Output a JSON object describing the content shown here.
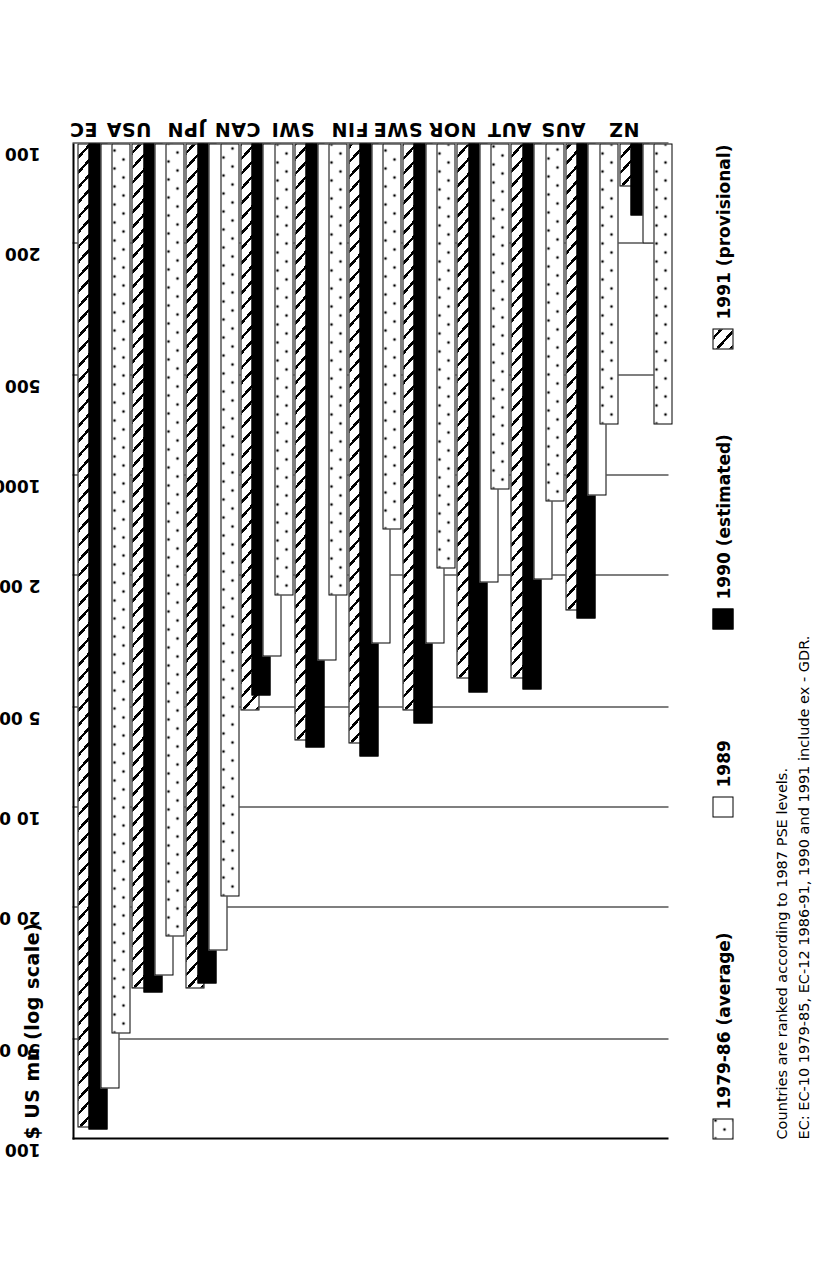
{
  "chart_data": {
    "type": "bar",
    "orientation": "horizontal",
    "title": "",
    "xlabel": "$ US mn (log scale)",
    "ylabel": "",
    "scale": "log",
    "xlim": [
      100,
      100000
    ],
    "grid": true,
    "tick_labels": [
      "100 000",
      "50 000",
      "20 000",
      "10 000",
      "5 000",
      "2 000",
      "1000",
      "500",
      "200",
      "100"
    ],
    "tick_values": [
      100000,
      50000,
      20000,
      10000,
      5000,
      2000,
      1000,
      500,
      200,
      100
    ],
    "categories": [
      "EC",
      "USA",
      "JPN",
      "CAN",
      "SWI",
      "FIN",
      "SWE",
      "NOR",
      "AUT",
      "AUS",
      "NZ"
    ],
    "legend_position": "below-axis",
    "series": [
      {
        "name": "1979-86 (average)",
        "fill": "dotted",
        "values": [
          48000,
          24500,
          18500,
          2300,
          2300,
          1450,
          1900,
          1100,
          1200,
          700,
          700
        ]
      },
      {
        "name": "1989",
        "fill": "white",
        "values": [
          70000,
          32000,
          27000,
          3500,
          3600,
          3200,
          3200,
          2100,
          2050,
          1150,
          200
        ]
      },
      {
        "name": "1990 (estimated)",
        "fill": "black",
        "values": [
          93000,
          36000,
          34000,
          4600,
          6600,
          7000,
          5600,
          4500,
          4400,
          2700,
          165
        ]
      },
      {
        "name": "1991 (provisional)",
        "fill": "hatched",
        "values": [
          92000,
          35000,
          35000,
          5100,
          6300,
          6400,
          5100,
          4100,
          4100,
          2550,
          135
        ]
      }
    ],
    "notes": [
      "Countries are ranked according to 1987 PSE levels.",
      "EC: EC-10 1979-85, EC-12 1986-91, 1990 and 1991 include ex - GDR."
    ]
  },
  "colors": {
    "ink": "#000000",
    "paper": "#ffffff"
  }
}
